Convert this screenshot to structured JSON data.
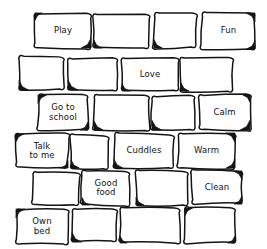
{
  "diagram": {
    "type": "brick-wall",
    "style": "hand-drawn",
    "stroke_color": "#141414",
    "fill_color": "#ffffff",
    "background_color": "#ffffff",
    "rows": 6,
    "bricks_per_row": 4,
    "total_bricks": 24,
    "labelled_bricks": 10,
    "blank_bricks": 14
  },
  "bricks": [
    {
      "row": 1,
      "col": 1,
      "label": "Play",
      "x": 35,
      "y": 13,
      "w": 56,
      "h": 35,
      "shadow": "both"
    },
    {
      "row": 1,
      "col": 2,
      "label": "",
      "x": 94,
      "y": 14,
      "w": 55,
      "h": 34,
      "shadow": "bottom-left"
    },
    {
      "row": 1,
      "col": 3,
      "label": "",
      "x": 154,
      "y": 13,
      "w": 42,
      "h": 35,
      "shadow": "bottom-left"
    },
    {
      "row": 1,
      "col": 4,
      "label": "Fun",
      "x": 202,
      "y": 13,
      "w": 53,
      "h": 36,
      "shadow": "right"
    },
    {
      "row": 2,
      "col": 1,
      "label": "",
      "x": 19,
      "y": 57,
      "w": 45,
      "h": 33,
      "shadow": "bottom-left"
    },
    {
      "row": 2,
      "col": 2,
      "label": "",
      "x": 68,
      "y": 58,
      "w": 49,
      "h": 32,
      "shadow": "bottom-left"
    },
    {
      "row": 2,
      "col": 3,
      "label": "Love",
      "x": 122,
      "y": 58,
      "w": 56,
      "h": 33,
      "shadow": "bottom-left"
    },
    {
      "row": 2,
      "col": 4,
      "label": "",
      "x": 181,
      "y": 58,
      "w": 51,
      "h": 33,
      "shadow": "bottom-left"
    },
    {
      "row": 3,
      "col": 1,
      "label": "Go to\nschool",
      "x": 38,
      "y": 95,
      "w": 50,
      "h": 35,
      "shadow": "both"
    },
    {
      "row": 3,
      "col": 2,
      "label": "",
      "x": 94,
      "y": 96,
      "w": 55,
      "h": 34,
      "shadow": "bottom-left"
    },
    {
      "row": 3,
      "col": 3,
      "label": "",
      "x": 152,
      "y": 96,
      "w": 42,
      "h": 34,
      "shadow": "bottom-left"
    },
    {
      "row": 3,
      "col": 4,
      "label": "Calm",
      "x": 199,
      "y": 95,
      "w": 51,
      "h": 35,
      "shadow": "right"
    },
    {
      "row": 4,
      "col": 1,
      "label": "Talk\nto me",
      "x": 16,
      "y": 134,
      "w": 52,
      "h": 34,
      "shadow": "both"
    },
    {
      "row": 4,
      "col": 2,
      "label": "",
      "x": 71,
      "y": 135,
      "w": 38,
      "h": 33,
      "shadow": "bottom-left"
    },
    {
      "row": 4,
      "col": 3,
      "label": "Cuddles",
      "x": 114,
      "y": 134,
      "w": 60,
      "h": 34,
      "shadow": "bottom-left"
    },
    {
      "row": 4,
      "col": 4,
      "label": "Warm",
      "x": 178,
      "y": 133,
      "w": 57,
      "h": 35,
      "shadow": "right"
    },
    {
      "row": 5,
      "col": 1,
      "label": "",
      "x": 33,
      "y": 172,
      "w": 46,
      "h": 33,
      "shadow": "none"
    },
    {
      "row": 5,
      "col": 2,
      "label": "Good\nfood",
      "x": 82,
      "y": 171,
      "w": 48,
      "h": 34,
      "shadow": "bottom-left"
    },
    {
      "row": 5,
      "col": 3,
      "label": "",
      "x": 136,
      "y": 171,
      "w": 52,
      "h": 34,
      "shadow": "bottom-left"
    },
    {
      "row": 5,
      "col": 4,
      "label": "Clean",
      "x": 192,
      "y": 171,
      "w": 50,
      "h": 33,
      "shadow": "right"
    },
    {
      "row": 6,
      "col": 1,
      "label": "Own\nbed",
      "x": 16,
      "y": 209,
      "w": 52,
      "h": 35,
      "shadow": "left"
    },
    {
      "row": 6,
      "col": 2,
      "label": "",
      "x": 72,
      "y": 209,
      "w": 44,
      "h": 33,
      "shadow": "bottom-left"
    },
    {
      "row": 6,
      "col": 3,
      "label": "",
      "x": 120,
      "y": 208,
      "w": 60,
      "h": 35,
      "shadow": "bottom-left"
    },
    {
      "row": 6,
      "col": 4,
      "label": "",
      "x": 185,
      "y": 208,
      "w": 50,
      "h": 35,
      "shadow": "both"
    }
  ]
}
